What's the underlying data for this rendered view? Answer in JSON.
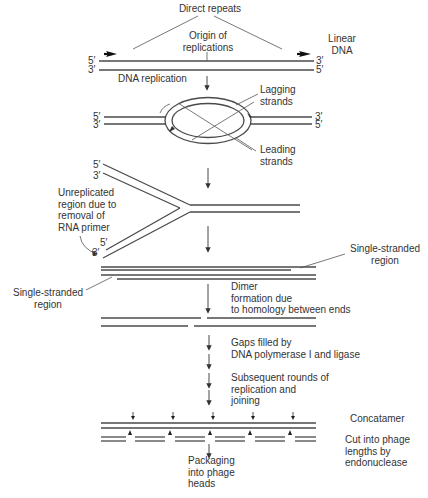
{
  "diagram": {
    "title_labels": {
      "direct_repeats": "Direct repeats",
      "origin": "Origin of\nreplications",
      "linear_dna": "Linear\nDNA",
      "dna_replication": "DNA replication",
      "lagging": "Lagging\nstrands",
      "leading": "Leading\nstrands",
      "unreplicated": "Unreplicated\nregion due to\nremoval of\nRNA primer",
      "ss_right": "Single-stranded\nregion",
      "ss_left": "Single-stranded\nregion",
      "dimer": "Dimer\nformation due\nto homology between ends",
      "gaps": "Gaps filled by\nDNA polymerase I and ligase",
      "subsequent": "Subsequent rounds of\nreplication and\njoining",
      "concatamer": "Concatamer",
      "cut": "Cut into phage\nlengths by\nendonuclease",
      "packaging": "Packaging\ninto phage\nheads"
    },
    "end_labels": {
      "five_prime": "5′",
      "three_prime": "3′"
    },
    "steps": [
      "Linear DNA with direct repeats",
      "DNA replication bubble",
      "Replication fork with unreplicated ends",
      "Two daughter molecules with single-stranded regions",
      "Dimer formation due to homology between ends",
      "Gaps filled by DNA polymerase I and ligase",
      "Subsequent rounds of replication and joining",
      "Concatamer",
      "Cut into phage lengths by endonuclease",
      "Packaging into phage heads"
    ]
  }
}
